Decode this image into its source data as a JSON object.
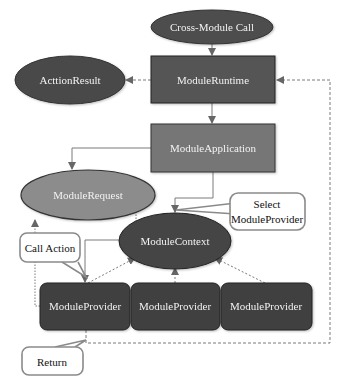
{
  "diagram": {
    "colors": {
      "dark_node": "#4a4a4a",
      "runtime_node": "#555555",
      "application_node": "#767676",
      "request_node": "#8c8c8c",
      "context_node": "#444444",
      "provider_node": "#3f3f3f",
      "edge": "#7a7a7a",
      "callout_border": "#8a8a8a"
    },
    "nodes": {
      "cross_module_call": "Cross-Module Call",
      "module_runtime": "ModuleRuntime",
      "action_result": "ActtionResult",
      "module_application": "ModuleApplication",
      "module_request": "ModuleRequest",
      "module_context": "ModuleContext",
      "providers": [
        "ModuleProvider",
        "ModuleProvider",
        "ModuleProvider"
      ]
    },
    "callouts": {
      "select_provider_line1": "Select",
      "select_provider_line2": "ModuleProvider",
      "call_action": "Call Action",
      "return": "Return"
    },
    "edges": [
      {
        "from": "Cross-Module Call",
        "to": "ModuleRuntime",
        "style": "solid"
      },
      {
        "from": "ModuleRuntime",
        "to": "ActtionResult",
        "style": "dashed"
      },
      {
        "from": "ModuleRuntime",
        "to": "ModuleApplication",
        "style": "solid"
      },
      {
        "from": "ModuleApplication",
        "to": "ModuleRequest",
        "style": "solid"
      },
      {
        "from": "ModuleApplication",
        "to": "ModuleContext",
        "style": "solid"
      },
      {
        "from": "ModuleContext",
        "to": "ModuleRequest",
        "style": "dotted"
      },
      {
        "from": "ModuleContext",
        "to": "ModuleProvider 1",
        "style": "solid"
      },
      {
        "from": "ModuleProvider 1",
        "to": "ModuleRequest",
        "style": "dotted"
      },
      {
        "from": "ModuleProvider 1",
        "to": "ModuleContext",
        "style": "dotted"
      },
      {
        "from": "ModuleProvider 2",
        "to": "ModuleContext",
        "style": "dotted"
      },
      {
        "from": "ModuleProvider 3",
        "to": "ModuleContext",
        "style": "dotted"
      },
      {
        "from": "ModuleProvider 1",
        "to": "ModuleRuntime",
        "style": "dashed"
      }
    ]
  }
}
